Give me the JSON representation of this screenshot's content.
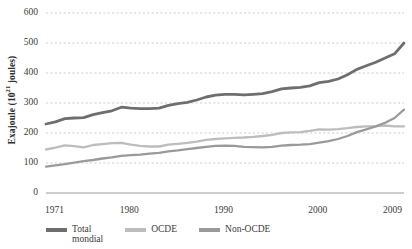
{
  "axes": {
    "ylabel": "Exajoule (10",
    "ylabel_exp": "21",
    "ylabel_tail": " joules)",
    "yticks": [
      "600",
      "500",
      "400",
      "300",
      "200",
      "100",
      "0"
    ],
    "xticks": [
      "1971",
      "1980",
      "1990",
      "2000",
      "2009"
    ]
  },
  "legend": {
    "items": [
      {
        "label": "Total\nmondial",
        "color": "#6e6e6e"
      },
      {
        "label": "OCDE",
        "color": "#bdbdbd"
      },
      {
        "label": "Non-OCDE",
        "color": "#9a9a9a"
      }
    ]
  },
  "colors": {
    "total": "#6e6e6e",
    "ocde": "#bdbdbd",
    "non_ocde": "#9a9a9a",
    "grid": "#c9c9c9",
    "axis": "#9e9e9e",
    "text": "#3b3b3b"
  },
  "chart_data": {
    "type": "line",
    "title": "",
    "xlabel": "",
    "ylabel": "Exajoule (10^21 joules)",
    "xlim": [
      1971,
      2009
    ],
    "ylim": [
      0,
      600
    ],
    "ytick_values": [
      0,
      100,
      200,
      300,
      400,
      500,
      600
    ],
    "xtick_values": [
      1971,
      1980,
      1990,
      2000,
      2009
    ],
    "grid": "horizontal-dashed",
    "legend_position": "bottom-left",
    "x": [
      1971,
      1972,
      1973,
      1974,
      1975,
      1976,
      1977,
      1978,
      1979,
      1980,
      1981,
      1982,
      1983,
      1984,
      1985,
      1986,
      1987,
      1988,
      1989,
      1990,
      1991,
      1992,
      1993,
      1994,
      1995,
      1996,
      1997,
      1998,
      1999,
      2000,
      2001,
      2002,
      2003,
      2004,
      2005,
      2006,
      2007,
      2008,
      2009
    ],
    "series": [
      {
        "name": "Total mondial",
        "color": "#6e6e6e",
        "values": [
          230,
          237,
          248,
          250,
          251,
          261,
          268,
          274,
          286,
          283,
          281,
          281,
          283,
          292,
          298,
          302,
          310,
          320,
          326,
          329,
          329,
          327,
          329,
          331,
          338,
          347,
          350,
          352,
          357,
          368,
          372,
          380,
          394,
          412,
          424,
          436,
          450,
          464,
          500
        ]
      },
      {
        "name": "OCDE",
        "color": "#bdbdbd",
        "values": [
          145,
          151,
          159,
          156,
          152,
          160,
          163,
          166,
          167,
          161,
          157,
          155,
          155,
          161,
          164,
          167,
          171,
          177,
          180,
          182,
          184,
          185,
          187,
          190,
          194,
          200,
          202,
          203,
          207,
          212,
          211,
          213,
          216,
          220,
          222,
          223,
          225,
          222,
          222
        ]
      },
      {
        "name": "Non-OCDE",
        "color": "#9a9a9a",
        "values": [
          88,
          92,
          96,
          101,
          106,
          110,
          115,
          119,
          124,
          126,
          128,
          131,
          134,
          139,
          142,
          146,
          150,
          154,
          157,
          158,
          157,
          154,
          153,
          152,
          154,
          158,
          160,
          161,
          163,
          168,
          173,
          180,
          190,
          203,
          212,
          222,
          234,
          250,
          278
        ]
      }
    ]
  }
}
